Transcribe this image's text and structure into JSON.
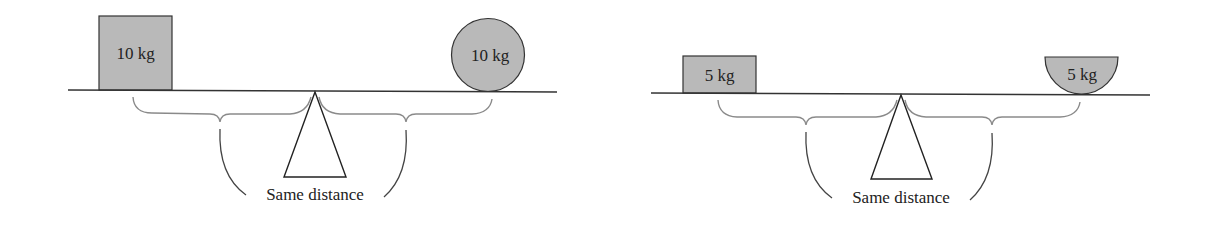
{
  "diagram": {
    "colors": {
      "beam": "#333333",
      "mass_fill": "#b9b9b9",
      "mass_stroke": "#333333",
      "brace": "#8a8a8a",
      "leader": "#444444",
      "fulcrum": "#222222",
      "text": "#222222"
    },
    "panels": [
      {
        "name": "balance-10kg",
        "left_mass": {
          "shape": "square",
          "label": "10 kg"
        },
        "right_mass": {
          "shape": "circle",
          "label": "10 kg"
        },
        "caption": "Same distance"
      },
      {
        "name": "balance-5kg",
        "left_mass": {
          "shape": "rectangle",
          "label": "5 kg"
        },
        "right_mass": {
          "shape": "half-disc",
          "label": "5 kg"
        },
        "caption": "Same distance"
      }
    ]
  }
}
